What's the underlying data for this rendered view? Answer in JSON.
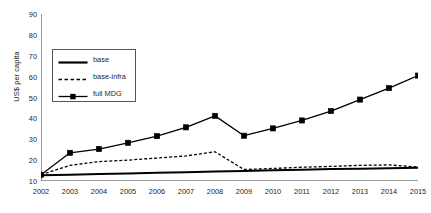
{
  "chart_data": {
    "type": "line",
    "title": "",
    "xlabel": "",
    "ylabel": "US$ per capita",
    "categories": [
      "2002",
      "2003",
      "2004",
      "2005",
      "2006",
      "2007",
      "2008",
      "2009",
      "2010",
      "2011",
      "2012",
      "2013",
      "2014",
      "2015"
    ],
    "x": [
      2002,
      2003,
      2004,
      2005,
      2006,
      2007,
      2008,
      2009,
      2010,
      2011,
      2012,
      2013,
      2014,
      2015
    ],
    "ylim": [
      10,
      90
    ],
    "yticks": [
      10,
      20,
      30,
      40,
      50,
      60,
      70,
      80,
      90
    ],
    "xlim": [
      2002,
      2015
    ],
    "grid": false,
    "legend_position": "upper-left-inside",
    "series": [
      {
        "name": "base",
        "style": "solid",
        "marker": "none",
        "color": "#000000",
        "values": [
          12.7,
          13.0,
          13.3,
          13.6,
          13.9,
          14.2,
          14.5,
          14.8,
          15.1,
          15.4,
          15.7,
          15.9,
          16.1,
          16.3
        ]
      },
      {
        "name": "base-infra",
        "style": "dashed",
        "marker": "none",
        "color": "#000000",
        "values": [
          13.0,
          17.5,
          19.3,
          20.0,
          21.0,
          22.0,
          24.0,
          15.5,
          16.0,
          16.6,
          17.0,
          17.5,
          17.7,
          16.7
        ]
      },
      {
        "name": "full MDG",
        "style": "solid",
        "marker": "square",
        "color": "#000000",
        "values": [
          13.0,
          23.5,
          25.3,
          28.3,
          31.5,
          35.7,
          41.2,
          31.7,
          35.2,
          39.0,
          43.5,
          49.0,
          54.5,
          60.5
        ]
      }
    ]
  },
  "legend": {
    "items": [
      {
        "label": "base",
        "swatch": "solid-line-swatch"
      },
      {
        "label": "base-infra",
        "swatch": "dashed-line-swatch"
      },
      {
        "label": "full MDG",
        "swatch": "square-marker-line-swatch"
      }
    ]
  },
  "axes": {
    "y_title": "US$ per capita",
    "y_tick_labels": [
      "90",
      "80",
      "70",
      "60",
      "50",
      "40",
      "30",
      "20",
      "10"
    ],
    "x_tick_labels": [
      "2002",
      "2003",
      "2004",
      "2005",
      "2006",
      "2007",
      "2008",
      "2009",
      "2010",
      "2011",
      "2012",
      "2013",
      "2014",
      "2015"
    ]
  }
}
